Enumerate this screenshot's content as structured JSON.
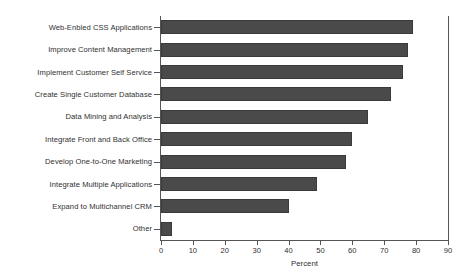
{
  "chart_data": {
    "type": "bar",
    "orientation": "horizontal",
    "title": "",
    "xlabel": "Percent",
    "ylabel": "",
    "xlim": [
      0,
      90
    ],
    "xticks": [
      0,
      10,
      20,
      30,
      40,
      50,
      60,
      70,
      80,
      90
    ],
    "grid": false,
    "legend": null,
    "bar_color": "#4a4a4a",
    "bar_edge_color": "#3a3a3a",
    "axis_color": "#555555",
    "categories": [
      "Web-Enbled CSS Applications",
      "Improve Content Management",
      "Implement Customer Self Service",
      "Create Single Customer Database",
      "Data Mining and Analysis",
      "Integrate Front and Back Office",
      "Develop One-to-One Marketing",
      "Integrate Multiple Applications",
      "Expand to Multichannel CRM",
      "Other"
    ],
    "values": [
      79,
      77.5,
      76,
      72,
      65,
      60,
      58,
      49,
      40,
      3.5
    ]
  }
}
